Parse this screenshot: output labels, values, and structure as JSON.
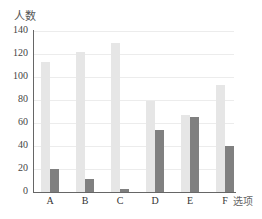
{
  "chart_data": {
    "type": "bar",
    "title": "",
    "xlabel": "选项",
    "ylabel": "人数",
    "categories": [
      "A",
      "B",
      "C",
      "D",
      "E",
      "F"
    ],
    "series": [
      {
        "name": "series-1",
        "color": "#e6e6e6",
        "values": [
          113,
          122,
          130,
          79,
          67,
          93
        ]
      },
      {
        "name": "series-2",
        "color": "#808080",
        "values": [
          20,
          11,
          3,
          54,
          65,
          40
        ]
      }
    ],
    "yticks": [
      0,
      20,
      40,
      60,
      80,
      100,
      120,
      140
    ],
    "ylim": [
      0,
      140
    ],
    "grid": true,
    "legend": null
  }
}
